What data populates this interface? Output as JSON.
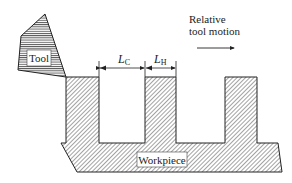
{
  "diagram": {
    "tool": {
      "label": "Tool"
    },
    "workpiece": {
      "label": "Workpiece"
    },
    "dimensions": {
      "cut_length": {
        "symbol": "L",
        "subscript": "C"
      },
      "hold_length": {
        "symbol": "L",
        "subscript": "H"
      }
    },
    "motion": {
      "line1": "Relative",
      "line2": "tool motion"
    }
  },
  "colors": {
    "stroke": "#222222",
    "background": "#ffffff"
  }
}
